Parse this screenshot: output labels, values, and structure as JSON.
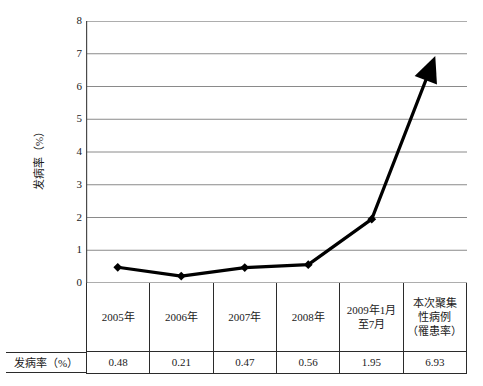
{
  "chart_data": {
    "type": "line",
    "title": "",
    "xlabel": "",
    "ylabel": "发病率（%）",
    "ylim": [
      0,
      8
    ],
    "yticks": [
      0,
      1,
      2,
      3,
      4,
      5,
      6,
      7,
      8
    ],
    "ytick_labels": [
      "0",
      "1",
      "2",
      "3",
      "4",
      "5",
      "6",
      "7",
      "8"
    ],
    "grid": true,
    "grid_axis": "y",
    "legend": "none",
    "marker": "diamond",
    "end_marker": "up-arrow",
    "line_color": "#000000",
    "grid_color": "#8a8a8a",
    "categories": [
      "2005年",
      "2006年",
      "2007年",
      "2008年",
      "2009年1月至7月",
      "本次聚集性病例（罹患率）"
    ],
    "values": [
      0.48,
      0.21,
      0.47,
      0.56,
      1.95,
      6.93
    ],
    "series": [
      {
        "name": "发病率（%）",
        "values": [
          0.48,
          0.21,
          0.47,
          0.56,
          1.95,
          6.93
        ]
      }
    ]
  },
  "table": {
    "row_header_label": "发病率（%）",
    "period_cells": [
      {
        "lines": [
          "2005年"
        ]
      },
      {
        "lines": [
          "2006年"
        ]
      },
      {
        "lines": [
          "2007年"
        ]
      },
      {
        "lines": [
          "2008年"
        ]
      },
      {
        "lines": [
          "2009年1月",
          "至7月"
        ]
      },
      {
        "lines": [
          "本次聚集",
          "性病例",
          "（罹患率）"
        ]
      }
    ],
    "value_cells": [
      "0.48",
      "0.21",
      "0.47",
      "0.56",
      "1.95",
      "6.93"
    ]
  },
  "axis": {
    "y_title": "发病率（%）",
    "y_ticks": [
      "8",
      "7",
      "6",
      "5",
      "4",
      "3",
      "2",
      "1",
      "0"
    ]
  }
}
